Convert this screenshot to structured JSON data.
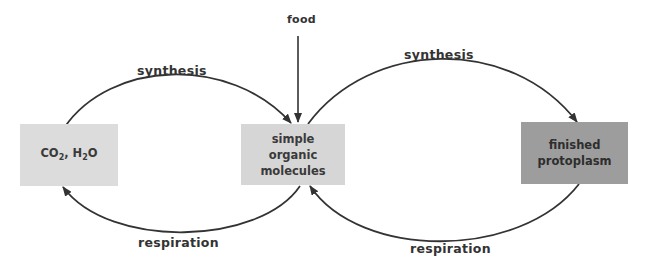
{
  "diagram": {
    "nodes": {
      "co2_h2o": {
        "prefix": "CO",
        "sub1": "2",
        "mid": ", H",
        "sub2": "2",
        "suffix": "O"
      },
      "simple": {
        "line1": "simple",
        "line2": "organic",
        "line3": "molecules"
      },
      "finished": {
        "line1": "finished",
        "line2": "protoplasm"
      }
    },
    "labels": {
      "food": "food",
      "synthesis_left": "synthesis",
      "synthesis_right": "synthesis",
      "respiration_left": "respiration",
      "respiration_right": "respiration"
    },
    "colors": {
      "line": "#333333",
      "co2_box": "#dcdcdc",
      "simple_box": "#d6d6d6",
      "finished_box": "#9d9d9d"
    }
  }
}
